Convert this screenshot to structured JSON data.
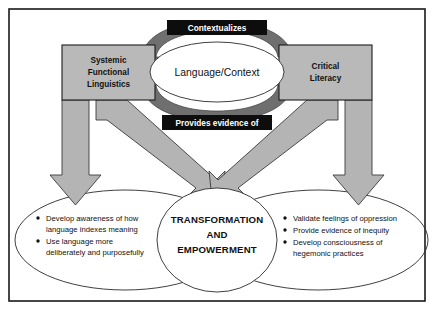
{
  "figure": {
    "frame_color": "#1a1a1a",
    "box_fill": "#b9b9b9",
    "arrow_fill": "#b4b4b4",
    "loop_arrow_fill": "#6f6f6f",
    "plate_fill": "#0d0d0d",
    "plate_text_color": "#ffffff"
  },
  "cycle": {
    "top_label": "Contextualizes",
    "bottom_label": "Provides evidence of",
    "center_label": "Language/Context"
  },
  "boxes": {
    "left": {
      "line1": "Systemic",
      "line2": "Functional",
      "line3": "Linguistics"
    },
    "right": {
      "line1": "Critical",
      "line2": "Literacy"
    }
  },
  "outcome": {
    "line1": "TRANSFORMATION",
    "line2": "AND",
    "line3": "EMPOWERMENT"
  },
  "left_outcomes": {
    "bullets": [
      {
        "line1": "Develop awareness of how",
        "line2": "language indexes meaning"
      },
      {
        "line1": "Use language more",
        "line2": "deliberately and purposefully"
      }
    ]
  },
  "right_outcomes": {
    "bullets": [
      {
        "line1": "Validate feelings of oppression",
        "line2": ""
      },
      {
        "line1": "Provide evidence of inequity",
        "line2": ""
      },
      {
        "line1": "Develop consciousness of",
        "line2": "hegemonic practices"
      }
    ]
  }
}
